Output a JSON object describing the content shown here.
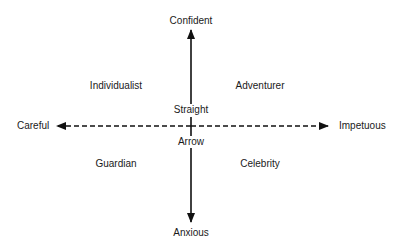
{
  "diagram": {
    "type": "quadrant",
    "axes": {
      "vertical": {
        "top": "Confident",
        "bottom": "Anxious",
        "style": "solid"
      },
      "horizontal": {
        "left": "Careful",
        "right": "Impetuous",
        "style": "dashed"
      }
    },
    "quadrants": {
      "top_left": "Individualist",
      "top_right": "Adventurer",
      "bottom_left": "Guardian",
      "bottom_right": "Celebrity"
    },
    "center": {
      "above": "Straight",
      "below": "Arrow"
    },
    "colors": {
      "line": "#111111",
      "text": "#1a1a1a",
      "background": "#ffffff"
    }
  }
}
